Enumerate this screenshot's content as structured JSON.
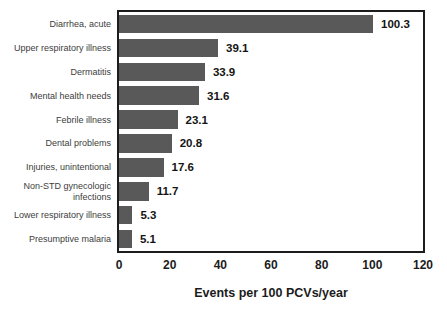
{
  "chart_data": {
    "type": "bar",
    "orientation": "horizontal",
    "title": "",
    "categories": [
      "Diarrhea, acute",
      "Upper respiratory illness",
      "Dermatitis",
      "Mental health needs",
      "Febrile illness",
      "Dental problems",
      "Injuries, unintentional",
      "Non-STD gynecologic infections",
      "Lower respiratory illness",
      "Presumptive malaria"
    ],
    "values": [
      100.3,
      39.1,
      33.9,
      31.6,
      23.1,
      20.8,
      17.6,
      11.7,
      5.3,
      5.1
    ],
    "value_labels": [
      "100.3",
      "39.1",
      "33.9",
      "31.6",
      "23.1",
      "20.8",
      "17.6",
      "11.7",
      "5.3",
      "5.1"
    ],
    "xlabel": "Events per 100 PCVs/year",
    "xticks": [
      "0",
      "20",
      "40",
      "60",
      "80",
      "100",
      "120"
    ],
    "xtick_values": [
      0,
      20,
      40,
      60,
      80,
      100,
      120
    ],
    "xlim": [
      0,
      120
    ],
    "grid": false,
    "legend": false,
    "colors": {
      "bar": "#595959",
      "plot_border": "#1c1c1c",
      "category_text": "#3d3d3d",
      "value_text": "#141414",
      "background": "#ffffff"
    }
  }
}
